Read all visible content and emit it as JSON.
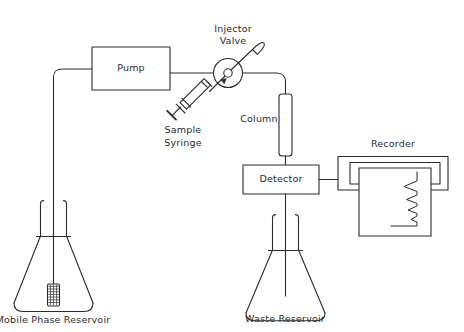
{
  "diagram": {
    "stroke_color": "#2b2b2b",
    "background_color": "#ffffff",
    "labels": {
      "pump": "Pump",
      "injector_valve_line1": "Injector",
      "injector_valve_line2": "Valve",
      "sample_syringe_line1": "Sample",
      "sample_syringe_line2": "Syringe",
      "column": "Column",
      "detector": "Detector",
      "recorder": "Recorder",
      "mobile_phase_reservoir": "Mobile Phase Reservoir",
      "waste_reservoir": "Waste Reservoir"
    },
    "components": [
      {
        "name": "mobile-phase-reservoir",
        "type": "erlenmeyer-flask",
        "label": "Mobile Phase Reservoir"
      },
      {
        "name": "inlet-filter",
        "type": "frit",
        "label": ""
      },
      {
        "name": "pump",
        "type": "box",
        "label": "Pump"
      },
      {
        "name": "injector-valve",
        "type": "rotary-valve",
        "label": "Injector Valve"
      },
      {
        "name": "sample-syringe",
        "type": "syringe",
        "label": "Sample Syringe"
      },
      {
        "name": "column",
        "type": "tube",
        "label": "Column"
      },
      {
        "name": "detector",
        "type": "box",
        "label": "Detector"
      },
      {
        "name": "recorder",
        "type": "chart-recorder",
        "label": "Recorder"
      },
      {
        "name": "waste-reservoir",
        "type": "erlenmeyer-flask",
        "label": "Waste Reservoir"
      }
    ],
    "chromatogram": {
      "description": "vertical baseline with four decreasing peaks",
      "peak_count": 4
    }
  }
}
